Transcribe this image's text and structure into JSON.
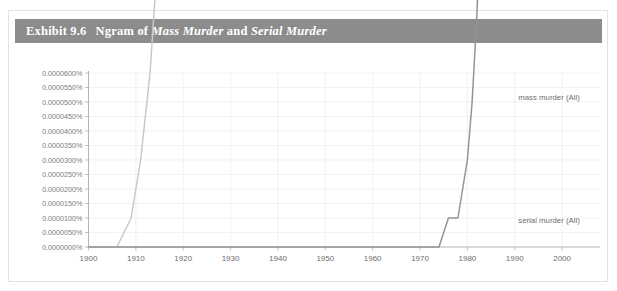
{
  "exhibit": {
    "number": "Exhibit 9.6",
    "title_prefix": "Ngram of ",
    "title_em1": "Mass Murder",
    "title_mid": " and ",
    "title_em2": "Serial Murder",
    "bar_color": "#8c8c8c",
    "bar_text_color": "#ffffff"
  },
  "chart_data": {
    "type": "line",
    "title": "Ngram of Mass Murder and Serial Murder",
    "xlabel": "",
    "ylabel": "",
    "xlim": [
      1900,
      2008
    ],
    "ylim": [
      0.0,
      6e-07
    ],
    "grid": true,
    "legend_position": "right-inline",
    "x_ticks": [
      1900,
      1910,
      1920,
      1930,
      1940,
      1950,
      1960,
      1970,
      1980,
      1990,
      2000
    ],
    "x_tick_labels": [
      "1900",
      "1910",
      "1920",
      "1930",
      "1940",
      "1950",
      "1960",
      "1970",
      "1980",
      "1990",
      "2000"
    ],
    "y_ticks": [
      0.0,
      5e-08,
      1e-07,
      1.5e-07,
      2e-07,
      2.5e-07,
      3e-07,
      3.5e-07,
      4e-07,
      4.5e-07,
      5e-07,
      5.5e-07,
      6e-07
    ],
    "y_tick_labels": [
      "0.0000000%",
      "0.0000050%",
      "0.0000100%",
      "0.0000150%",
      "0.0000200%",
      "0.0000250%",
      "0.0000300%",
      "0.0000350%",
      "0.0000400%",
      "0.0000450%",
      "0.0000500%",
      "0.0000550%",
      "0.0000600%"
    ],
    "series": [
      {
        "name": "mass murder (All)",
        "label": "mass murder (All)",
        "color": "#c9c9c9",
        "stroke_width": 1.5,
        "label_x": 2007,
        "label_y": 5.18e-07,
        "x": [
          1900,
          1903,
          1906,
          1909,
          1911,
          1913,
          1915,
          1916,
          1917,
          1918,
          1919,
          1920,
          1921,
          1922,
          1923,
          1924,
          1925,
          1926,
          1927,
          1928,
          1929,
          1930,
          1931,
          1932,
          1933,
          1934,
          1935,
          1936,
          1937,
          1938,
          1939,
          1940,
          1941,
          1942,
          1943,
          1944,
          1945,
          1946,
          1947,
          1948,
          1949,
          1950,
          1951,
          1952,
          1953,
          1954,
          1955,
          1956,
          1957,
          1958,
          1959,
          1960,
          1961,
          1962,
          1963,
          1964,
          1965,
          1966,
          1967,
          1968,
          1969,
          1970,
          1971,
          1972,
          1973,
          1974,
          1975,
          1976,
          1977,
          1978,
          1979,
          1980,
          1981,
          1982,
          1983,
          1984,
          1985,
          1986,
          1987,
          1988,
          1989,
          1990,
          1991,
          1992,
          1993,
          1994,
          1995,
          1996,
          1997,
          1998,
          1999,
          2000,
          2001,
          2002,
          2003,
          2004,
          2005,
          2006,
          2007,
          2008
        ],
        "y": [
          0.0,
          0.0,
          0.0,
          1e-07,
          3e-07,
          6e-07,
          1.1e-06,
          1.4e-06,
          1.7e-06,
          1.9e-06,
          2e-06,
          2e-06,
          1.9e-06,
          2e-06,
          2e-06,
          1.9e-06,
          1.8e-06,
          1.8e-06,
          1.9e-06,
          2.1e-06,
          2.4e-06,
          2.7e-06,
          3.1e-06,
          3.7e-06,
          4.5e-06,
          5.5e-06,
          6.8e-06,
          8.3e-06,
          9.9e-06,
          1.16e-05,
          1.34e-05,
          1.55e-05,
          1.8e-05,
          2.05e-05,
          2.28e-05,
          2.48e-05,
          2.6e-05,
          2.62e-05,
          2.58e-05,
          2.47e-05,
          2.32e-05,
          2.17e-05,
          2.09e-05,
          2.06e-05,
          2.04e-05,
          1.97e-05,
          1.92e-05,
          1.91e-05,
          1.9e-05,
          1.94e-05,
          1.99e-05,
          2.01e-05,
          2.06e-05,
          2.13e-05,
          2.18e-05,
          2.26e-05,
          2.35e-05,
          2.42e-05,
          2.45e-05,
          2.48e-05,
          2.52e-05,
          2.56e-05,
          2.59e-05,
          2.6e-05,
          2.61e-05,
          2.64e-05,
          2.7e-05,
          2.78e-05,
          2.88e-05,
          2.99e-05,
          3.11e-05,
          3.23e-05,
          3.32e-05,
          3.4e-05,
          3.52e-05,
          3.65e-05,
          3.76e-05,
          3.86e-05,
          3.96e-05,
          4.04e-05,
          4.12e-05,
          4.19e-05,
          4.27e-05,
          4.37e-05,
          4.47e-05,
          4.56e-05,
          4.64e-05,
          4.72e-05,
          4.81e-05,
          4.9e-05,
          4.98e-05,
          5.08e-05,
          5.19e-05,
          5.27e-05,
          5.3e-05,
          5.26e-05,
          5.21e-05,
          5.19e-05,
          5.18e-05,
          5.17e-05
        ]
      },
      {
        "name": "serial murder (All)",
        "label": "serial murder (All)",
        "color": "#949494",
        "stroke_width": 1.5,
        "label_x": 2007,
        "label_y": 9.3e-08,
        "x": [
          1900,
          1920,
          1940,
          1955,
          1965,
          1970,
          1974,
          1976,
          1978,
          1979,
          1980,
          1981,
          1982,
          1983,
          1984,
          1985,
          1986,
          1987,
          1988,
          1989,
          1990,
          1991,
          1992,
          1993,
          1994,
          1995,
          1996,
          1997,
          1998,
          1999,
          2000,
          2001,
          2002,
          2003,
          2004,
          2005,
          2006,
          2007,
          2008
        ],
        "y": [
          0.0,
          0.0,
          0.0,
          0.0,
          0.0,
          0.0,
          0.0,
          1e-07,
          1e-07,
          2e-07,
          3e-07,
          5e-07,
          8e-07,
          1.2e-06,
          1.7e-06,
          2.3e-06,
          3e-06,
          3.8e-06,
          4.5e-06,
          5.3e-06,
          6e-06,
          6.6e-06,
          7.3e-06,
          7.9e-06,
          8.4e-06,
          8.7e-06,
          8.8e-06,
          9.1e-06,
          9.5e-06,
          9.7e-06,
          9.8e-06,
          9.7e-06,
          9.4e-06,
          9e-06,
          8.7e-06,
          8.6e-06,
          8.7e-06,
          8.8e-06,
          8.8e-06
        ]
      }
    ]
  }
}
